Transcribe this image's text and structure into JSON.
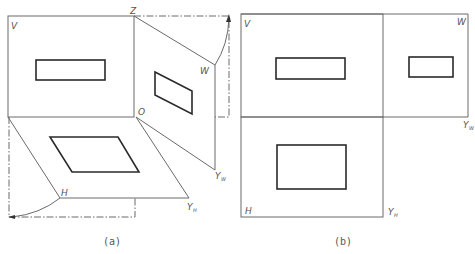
{
  "figure_a": {
    "caption": "(a)",
    "labels": {
      "v_plane": "V",
      "z_axis": "Z",
      "w_plane": "W",
      "origin": "O",
      "h_plane": "H",
      "y_w": "Y",
      "y_w_sub": "W",
      "y_h": "Y",
      "y_h_sub": "H"
    }
  },
  "figure_b": {
    "caption": "(b)",
    "labels": {
      "v_plane": "V",
      "w_plane": "W",
      "h_plane": "H",
      "y_w": "Y",
      "y_w_sub": "W",
      "y_h": "Y",
      "y_h_sub": "H"
    }
  },
  "colors": {
    "line": "#6a6a6a",
    "outline": "#2a2a2a",
    "background": "#ffffff"
  }
}
